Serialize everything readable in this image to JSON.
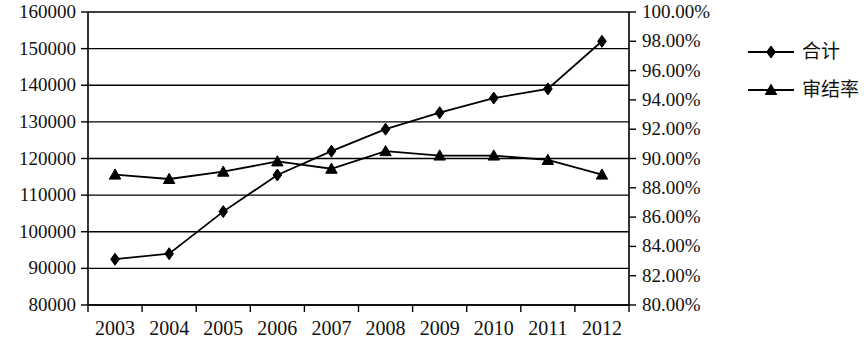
{
  "chart_data": {
    "type": "line",
    "title": "",
    "xlabel": "",
    "ylabel": "",
    "categories": [
      "2003",
      "2004",
      "2005",
      "2006",
      "2007",
      "2008",
      "2009",
      "2010",
      "2011",
      "2012"
    ],
    "series": [
      {
        "name": "合计",
        "axis": "left",
        "marker": "diamond",
        "values": [
          92500,
          94000,
          105500,
          115500,
          122000,
          128000,
          132500,
          136500,
          139000,
          152000
        ]
      },
      {
        "name": "审结率",
        "axis": "right",
        "marker": "triangle",
        "values": [
          0.889,
          0.886,
          0.891,
          0.898,
          0.893,
          0.905,
          0.902,
          0.902,
          0.899,
          0.889
        ]
      }
    ],
    "left_axis": {
      "min": 80000,
      "max": 160000,
      "step": 10000,
      "ticks": [
        "80000",
        "90000",
        "100000",
        "110000",
        "120000",
        "130000",
        "140000",
        "150000",
        "160000"
      ]
    },
    "right_axis": {
      "min": 0.8,
      "max": 1.0,
      "step": 0.02,
      "ticks": [
        "80.00%",
        "82.00%",
        "84.00%",
        "86.00%",
        "88.00%",
        "90.00%",
        "92.00%",
        "94.00%",
        "96.00%",
        "98.00%",
        "100.00%"
      ]
    },
    "legend": {
      "position": "right",
      "entries": [
        {
          "label": "合计",
          "marker": "diamond"
        },
        {
          "label": "审结率",
          "marker": "triangle"
        }
      ]
    },
    "grid": true,
    "colors": {
      "line": "#000000",
      "grid": "#000000",
      "background": "#ffffff"
    }
  }
}
